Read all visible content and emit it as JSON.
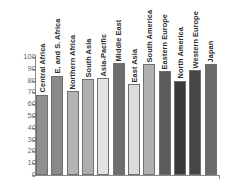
{
  "chart_data": {
    "type": "bar",
    "title": "",
    "xlabel": "",
    "ylabel": "",
    "ylim": [
      0,
      100
    ],
    "grid": false,
    "legend": "none",
    "yticks": [
      "100",
      "90",
      "80",
      "70",
      "60",
      "50",
      "40",
      "30",
      "20",
      "10",
      "0"
    ],
    "categories": [
      "Central Africa",
      "E. and S. Africa",
      "Northern Africa",
      "South Asia",
      "Asia-Pacific",
      "Middle East",
      "East Asia",
      "South America",
      "Eastern Europe",
      "North America",
      "Western Europe",
      "Japan"
    ],
    "values": [
      68,
      84,
      71,
      81,
      82,
      95,
      77,
      94,
      88,
      80,
      89,
      94
    ],
    "colors": [
      "#8f8f8f",
      "#8a8a8a",
      "#b4b4b4",
      "#aeaeae",
      "#e2e2e2",
      "#6e6e6e",
      "#dcdcdc",
      "#b0b0b0",
      "#5c5c5c",
      "#3a3a3a",
      "#464646",
      "#6a6a6a"
    ]
  },
  "axis": {
    "tick_color": "#8a8a8a",
    "label_color": "#6a6a6a"
  }
}
